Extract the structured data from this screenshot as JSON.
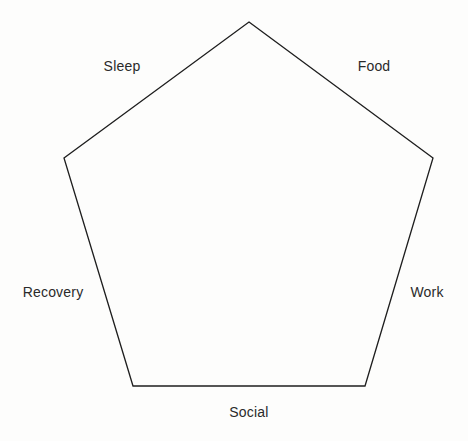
{
  "diagram": {
    "type": "pentagon-outline",
    "shape_name": "regular-pentagon",
    "background_color": "#fdfdfc",
    "stroke_color": "#1e1e1e",
    "stroke_width": 1.3,
    "fill": "none",
    "vertices": [
      {
        "id": "top",
        "x": 249,
        "y": 22
      },
      {
        "id": "right",
        "x": 433,
        "y": 158
      },
      {
        "id": "bottom-right",
        "x": 365,
        "y": 386
      },
      {
        "id": "bottom-left",
        "x": 133,
        "y": 386
      },
      {
        "id": "left",
        "x": 64,
        "y": 158
      }
    ],
    "path": "M 249 22 L 433 158 L 365 386 L 133 386 L 64 158 Z",
    "labels": [
      {
        "id": "sleep",
        "text": "Sleep",
        "x": 122,
        "y": 66,
        "anchor": "center"
      },
      {
        "id": "food",
        "text": "Food",
        "x": 374,
        "y": 66,
        "anchor": "center"
      },
      {
        "id": "work",
        "text": "Work",
        "x": 427,
        "y": 292,
        "anchor": "center"
      },
      {
        "id": "social",
        "text": "Social",
        "x": 249,
        "y": 412,
        "anchor": "center"
      },
      {
        "id": "recovery",
        "text": "Recovery",
        "x": 53,
        "y": 292,
        "anchor": "center"
      }
    ]
  }
}
